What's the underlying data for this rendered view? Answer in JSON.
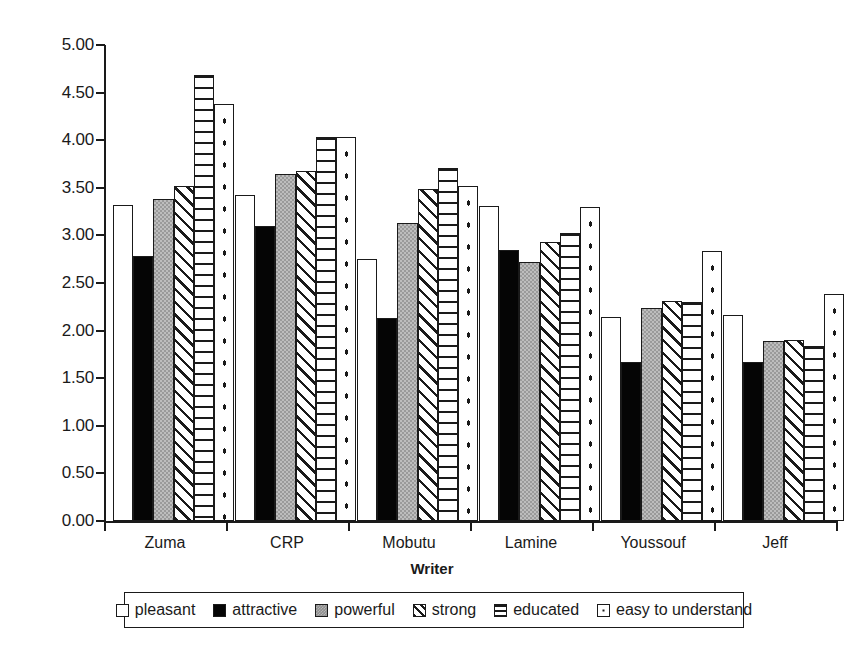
{
  "chart_data": {
    "type": "bar",
    "title": "",
    "xlabel": "Writer",
    "ylabel": "",
    "ylim": [
      0,
      5
    ],
    "ytick_step": 0.5,
    "grid": false,
    "legend_position": "bottom",
    "categories": [
      "Zuma",
      "CRP",
      "Mobutu",
      "Lamine",
      "Youssouf",
      "Jeff"
    ],
    "ytick_labels": [
      "0.00",
      "0.50",
      "1.00",
      "1.50",
      "2.00",
      "2.50",
      "3.00",
      "3.50",
      "4.00",
      "4.50",
      "5.00"
    ],
    "series": [
      {
        "name": "pleasant",
        "pattern": "white",
        "values": [
          3.32,
          3.42,
          2.75,
          3.31,
          2.14,
          2.16
        ]
      },
      {
        "name": "attractive",
        "pattern": "black",
        "values": [
          2.78,
          3.1,
          2.13,
          2.85,
          1.67,
          1.67
        ]
      },
      {
        "name": "powerful",
        "pattern": "gray",
        "values": [
          3.38,
          3.65,
          3.13,
          2.72,
          2.24,
          1.89
        ]
      },
      {
        "name": "strong",
        "pattern": "diagonal",
        "values": [
          3.52,
          3.68,
          3.49,
          2.93,
          2.31,
          1.9
        ]
      },
      {
        "name": "educated",
        "pattern": "horizontal",
        "values": [
          4.68,
          4.03,
          3.71,
          3.03,
          2.3,
          1.84
        ]
      },
      {
        "name": "easy to understand",
        "pattern": "dotted",
        "values": [
          4.38,
          4.03,
          3.52,
          3.3,
          2.84,
          2.38
        ]
      }
    ]
  },
  "axis": {
    "x_title": "Writer"
  },
  "colors": {
    "ink": "#1a1a1a",
    "paper": "#ffffff",
    "gray_fill": "#9a9a9a",
    "black_fill": "#050505"
  }
}
